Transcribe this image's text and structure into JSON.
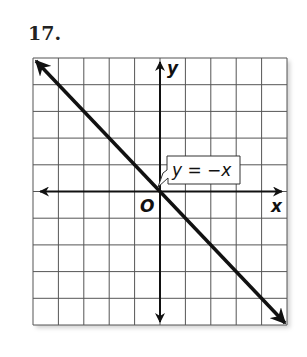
{
  "problem": {
    "number": "17."
  },
  "graph": {
    "grid": {
      "cols": 10,
      "rows": 10,
      "x_min": -5,
      "x_max": 5,
      "y_min": -5,
      "y_max": 5
    },
    "axes": {
      "x_label": "x",
      "y_label": "y",
      "origin_label": "O"
    },
    "line": {
      "equation": "y = −x",
      "slope": -1,
      "intercept": 0
    },
    "colors": {
      "grid": "#555555",
      "axis": "#111111",
      "line": "#111111",
      "background": "#ffffff"
    }
  }
}
